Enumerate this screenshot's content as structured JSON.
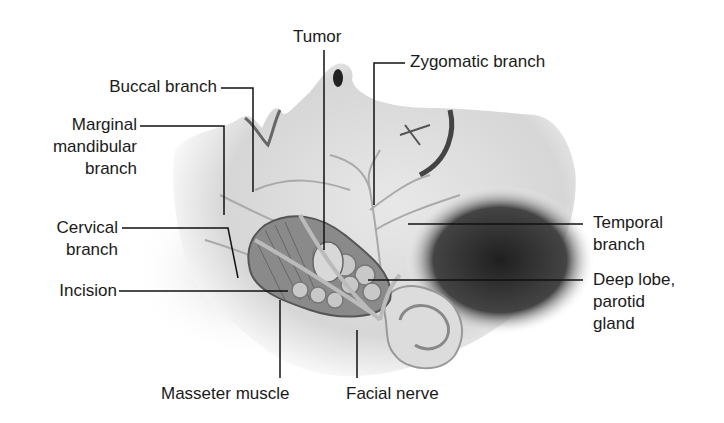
{
  "diagram": {
    "labels": {
      "tumor": "Tumor",
      "zygomatic": "Zygomatic branch",
      "buccal": "Buccal branch",
      "marginal": "Marginal\nmandibular\nbranch",
      "cervical": "Cervical\nbranch",
      "incision": "Incision",
      "temporal": "Temporal\nbranch",
      "deep_lobe": "Deep lobe,\nparotid\ngland",
      "masseter": "Masseter muscle",
      "facial_nerve": "Facial nerve"
    }
  }
}
